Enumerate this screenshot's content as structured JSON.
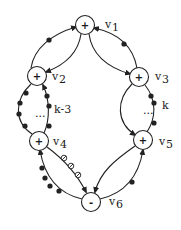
{
  "diagram": {
    "type": "signed directed graph",
    "nodes": [
      {
        "id": "v1",
        "label": "v",
        "sub": "1",
        "sign": "+",
        "x": 85,
        "y": 25
      },
      {
        "id": "v2",
        "label": "v",
        "sub": "2",
        "sign": "+",
        "x": 37,
        "y": 76
      },
      {
        "id": "v3",
        "label": "v",
        "sub": "3",
        "sign": "+",
        "x": 139,
        "y": 77
      },
      {
        "id": "v4",
        "label": "v",
        "sub": "4",
        "sign": "+",
        "x": 39,
        "y": 141
      },
      {
        "id": "v5",
        "label": "v",
        "sub": "5",
        "sign": "+",
        "x": 143,
        "y": 140
      },
      {
        "id": "v6",
        "label": "v",
        "sub": "6",
        "sign": "-",
        "x": 91,
        "y": 202
      }
    ],
    "annotations": [
      {
        "id": "k-3",
        "text": "k-3"
      },
      {
        "id": "k",
        "text": "k"
      },
      {
        "id": "ellipsis-left",
        "text": "..."
      },
      {
        "id": "ellipsis-right",
        "text": "..."
      }
    ],
    "colors": {
      "stroke": "#222222",
      "background": "#ffffff"
    }
  }
}
